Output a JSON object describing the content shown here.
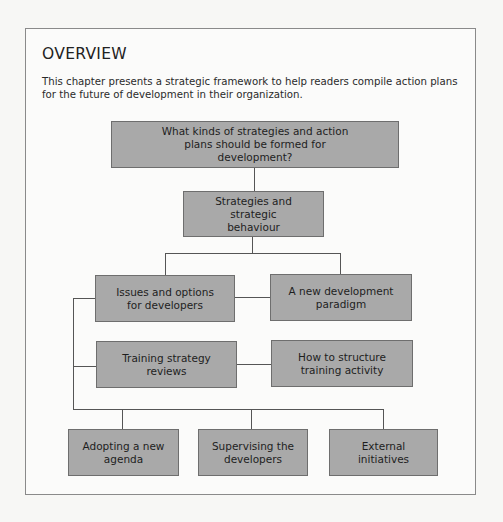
{
  "overview": {
    "title": "OVERVIEW",
    "intro": "This chapter presents a strategic framework to help readers compile action plans for the future of development in their organization."
  },
  "diagram": {
    "nodes": [
      {
        "id": "root",
        "label": "What kinds of strategies and action plans should be formed for development?"
      },
      {
        "id": "strategies",
        "label": "Strategies and strategic behaviour"
      },
      {
        "id": "issues",
        "label": "Issues and options for developers"
      },
      {
        "id": "paradigm",
        "label": "A new development paradigm"
      },
      {
        "id": "reviews",
        "label": "Training strategy reviews"
      },
      {
        "id": "structure",
        "label": "How to structure training activity"
      },
      {
        "id": "agenda",
        "label": "Adopting a new agenda"
      },
      {
        "id": "supervising",
        "label": "Supervising the developers"
      },
      {
        "id": "external",
        "label": "External initiatives"
      }
    ],
    "edges": [
      [
        "root",
        "strategies"
      ],
      [
        "strategies",
        "issues"
      ],
      [
        "strategies",
        "paradigm"
      ],
      [
        "issues",
        "paradigm"
      ],
      [
        "reviews",
        "structure"
      ],
      [
        "issues",
        "reviews"
      ],
      [
        "issues",
        "agenda"
      ],
      [
        "issues",
        "supervising"
      ],
      [
        "issues",
        "external"
      ]
    ],
    "colors": {
      "box_fill": "#a9a9a9",
      "box_border": "#6e6e6e",
      "line": "#555555",
      "frame_border": "#8a8a8a"
    }
  }
}
